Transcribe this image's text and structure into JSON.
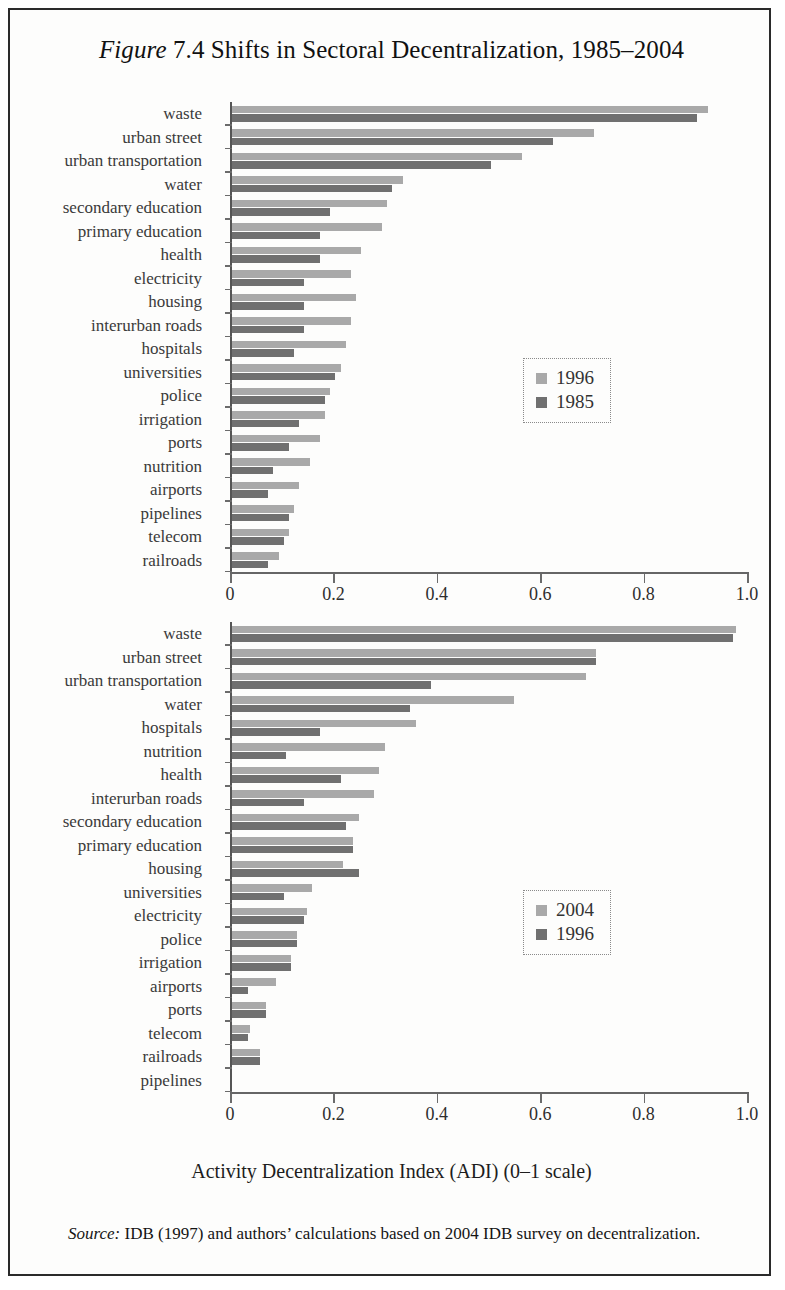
{
  "figure": {
    "label_italic": "Figure",
    "number_and_title": " 7.4 Shifts in Sectoral Decentralization, 1985–2004"
  },
  "axis_title": "Activity Decentralization Index (ADI) (0–1 scale)",
  "source": {
    "label_italic": "Source:",
    "text": " IDB (1997) and authors’ calculations based on 2004 IDB survey on decentralization."
  },
  "colors": {
    "series_light": "#a9a9a9",
    "series_dark": "#707070",
    "axis": "#6b6b6b",
    "frame": "#2a2a2a"
  },
  "chart_data": [
    {
      "type": "bar",
      "orientation": "horizontal",
      "panel": "top",
      "title": "",
      "xlabel": "Activity Decentralization Index (ADI) (0–1 scale)",
      "ylabel": "",
      "xlim": [
        0,
        1.0
      ],
      "xticks": [
        0,
        0.2,
        0.4,
        0.6,
        0.8,
        1.0
      ],
      "xtick_labels": [
        "0",
        "0.2",
        "0.4",
        "0.6",
        "0.8",
        "1.0"
      ],
      "grid": false,
      "legend_position": "center-right",
      "categories": [
        "waste",
        "urban street",
        "urban transportation",
        "water",
        "secondary education",
        "primary education",
        "health",
        "electricity",
        "housing",
        "interurban roads",
        "hospitals",
        "universities",
        "police",
        "irrigation",
        "ports",
        "nutrition",
        "airports",
        "pipelines",
        "telecom",
        "railroads"
      ],
      "series": [
        {
          "name": "1996",
          "color": "#a9a9a9",
          "values": [
            0.92,
            0.7,
            0.56,
            0.33,
            0.3,
            0.29,
            0.25,
            0.23,
            0.24,
            0.23,
            0.22,
            0.21,
            0.19,
            0.18,
            0.17,
            0.15,
            0.13,
            0.12,
            0.11,
            0.09
          ]
        },
        {
          "name": "1985",
          "color": "#707070",
          "values": [
            0.9,
            0.62,
            0.5,
            0.31,
            0.19,
            0.17,
            0.17,
            0.14,
            0.14,
            0.14,
            0.12,
            0.2,
            0.18,
            0.13,
            0.11,
            0.08,
            0.07,
            0.11,
            0.1,
            0.07
          ]
        }
      ]
    },
    {
      "type": "bar",
      "orientation": "horizontal",
      "panel": "bottom",
      "title": "",
      "xlabel": "Activity Decentralization Index (ADI) (0–1 scale)",
      "ylabel": "",
      "xlim": [
        0,
        1.0
      ],
      "xticks": [
        0,
        0.2,
        0.4,
        0.6,
        0.8,
        1.0
      ],
      "xtick_labels": [
        "0",
        "0.2",
        "0.4",
        "0.6",
        "0.8",
        "1.0"
      ],
      "grid": false,
      "legend_position": "center-right",
      "categories": [
        "waste",
        "urban street",
        "urban transportation",
        "water",
        "hospitals",
        "nutrition",
        "health",
        "interurban roads",
        "secondary education",
        "primary education",
        "housing",
        "universities",
        "electricity",
        "police",
        "irrigation",
        "airports",
        "ports",
        "telecom",
        "railroads",
        "pipelines"
      ],
      "series": [
        {
          "name": "2004",
          "color": "#a9a9a9",
          "values": [
            0.975,
            0.705,
            0.685,
            0.545,
            0.355,
            0.295,
            0.285,
            0.275,
            0.245,
            0.235,
            0.215,
            0.155,
            0.145,
            0.125,
            0.115,
            0.085,
            0.065,
            0.035,
            0.055,
            0.0
          ]
        },
        {
          "name": "1996",
          "color": "#707070",
          "values": [
            0.97,
            0.705,
            0.385,
            0.345,
            0.17,
            0.105,
            0.21,
            0.14,
            0.22,
            0.235,
            0.245,
            0.1,
            0.14,
            0.125,
            0.115,
            0.03,
            0.065,
            0.03,
            0.055,
            0.0
          ]
        }
      ]
    }
  ]
}
